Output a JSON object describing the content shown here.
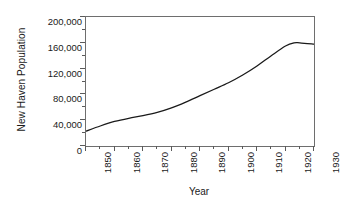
{
  "chart_data": {
    "type": "line",
    "title": "",
    "xlabel": "Year",
    "ylabel": "New Haven Population",
    "xlim": [
      1850,
      1930
    ],
    "ylim": [
      0,
      200000
    ],
    "grid": false,
    "legend": "none",
    "x_tick_labels": [
      "1850",
      "1860",
      "1870",
      "1880",
      "1890",
      "1900",
      "1910",
      "1920",
      "1930"
    ],
    "y_tick_labels": [
      "0",
      "40,000",
      "80,000",
      "120,000",
      "160,000",
      "200,000"
    ],
    "x_ticks": [
      1850,
      1860,
      1870,
      1880,
      1890,
      1900,
      1910,
      1920,
      1930
    ],
    "y_ticks": [
      0,
      40000,
      80000,
      120000,
      160000,
      200000
    ],
    "x_minor_tick_step": 5,
    "y_minor_tick_step": 20000,
    "series": [
      {
        "name": "New Haven Population",
        "color": "#1a1a1a",
        "line_width": 1.3,
        "x": [
          1850,
          1855,
          1860,
          1865,
          1870,
          1875,
          1880,
          1885,
          1890,
          1895,
          1900,
          1905,
          1910,
          1915,
          1920,
          1923,
          1925,
          1930
        ],
        "values": [
          23000,
          31000,
          38000,
          43000,
          47000,
          52000,
          59000,
          68000,
          78000,
          88000,
          98000,
          110000,
          124000,
          140000,
          155000,
          160000,
          160000,
          158000
        ]
      }
    ]
  },
  "axes": {
    "y_title": "New Haven Population",
    "x_title": "Year"
  }
}
